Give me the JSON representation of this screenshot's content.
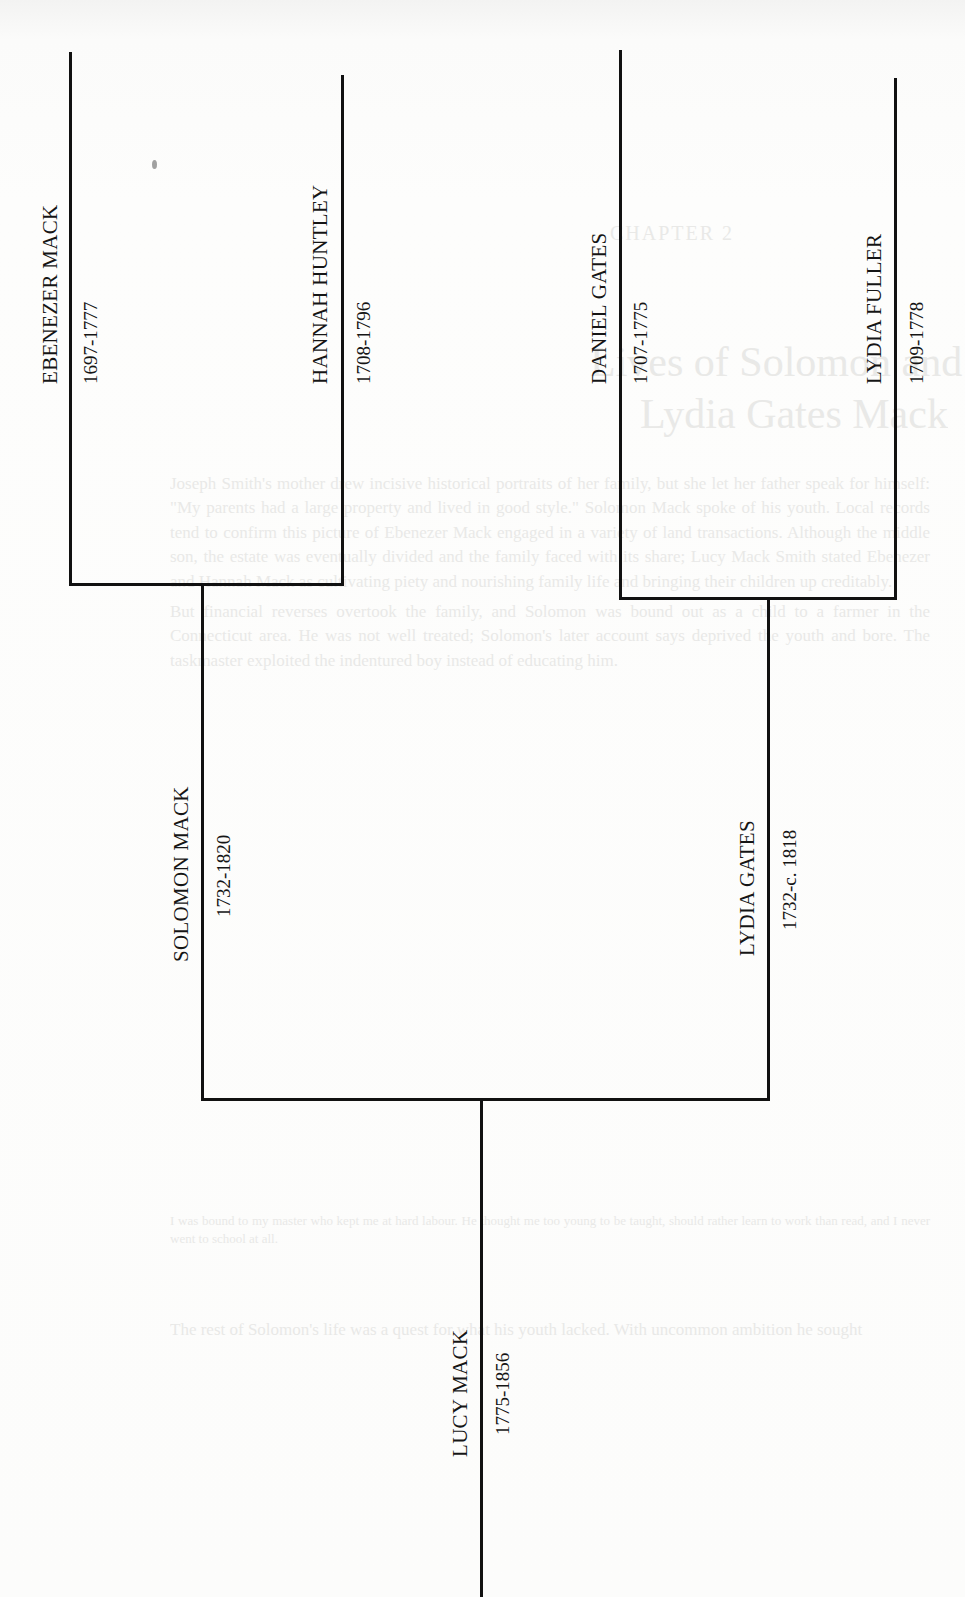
{
  "diagram": {
    "type": "pedigree-chart",
    "orientation": "rotated-90",
    "generations": [
      {
        "level": "great-grandparents",
        "people": [
          {
            "id": "ebenezer",
            "name": "EBENEZER MACK",
            "dates": "1697-1777"
          },
          {
            "id": "hannah",
            "name": "HANNAH HUNTLEY",
            "dates": "1708-1796"
          },
          {
            "id": "daniel",
            "name": "DANIEL GATES",
            "dates": "1707-1775"
          },
          {
            "id": "lydia_fuller",
            "name": "LYDIA FULLER",
            "dates": "1709-1778"
          }
        ]
      },
      {
        "level": "grandparents",
        "people": [
          {
            "id": "solomon",
            "name": "SOLOMON MACK",
            "dates": "1732-1820"
          },
          {
            "id": "lydia_gates",
            "name": "LYDIA GATES",
            "dates": "1732-c. 1818"
          }
        ]
      },
      {
        "level": "subject",
        "people": [
          {
            "id": "lucy",
            "name": "LUCY MACK",
            "dates": "1775-1856"
          }
        ]
      }
    ],
    "edges": [
      {
        "from": [
          "ebenezer",
          "hannah"
        ],
        "to": "solomon"
      },
      {
        "from": [
          "daniel",
          "lydia_fuller"
        ],
        "to": "lydia_gates"
      },
      {
        "from": [
          "solomon",
          "lydia_gates"
        ],
        "to": "lucy"
      }
    ]
  },
  "bleed_through": {
    "chapter": "CHAPTER 2",
    "title_line1": "Lives of Solomon and",
    "title_line2": "Lydia Gates Mack",
    "body": [
      "Joseph Smith's mother drew incisive historical portraits of her family, but she let her father speak for himself: \"My parents had a large property and lived in good style.\" Solomon Mack spoke of his youth. Local records tend to confirm this picture of Ebenezer Mack engaged in a variety of land transactions. Although the middle son, the estate was eventually divided and the family faced with its share; Lucy Mack Smith stated Ebenezer and Hannah Mack as cultivating piety and nourishing family life and bringing their children up creditably.",
      "But financial reverses overtook the family, and Solomon was bound out as a child to a farmer in the Connecticut area. He was not well treated; Solomon's later account says deprived the youth and bore. The taskmaster exploited the indentured boy instead of educating him."
    ],
    "note": "I was bound to my master who kept me at hard labour. He thought me too young to be taught, should rather learn to work than read, and I never went to school at all.",
    "closing": "The rest of Solomon's life was a quest for what his youth lacked. With uncommon ambition he sought"
  }
}
